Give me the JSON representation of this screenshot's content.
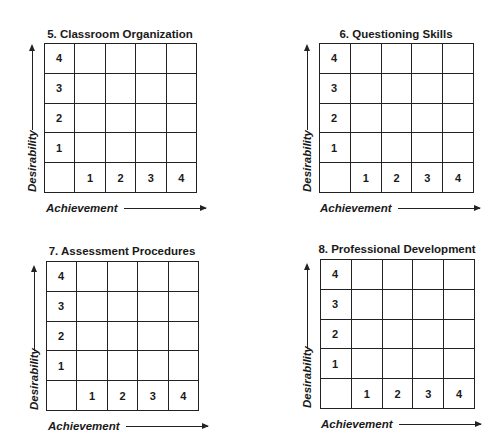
{
  "panels": [
    {
      "title": "5. Classroom Organization",
      "y_axis_label": "Desirability",
      "x_axis_label": "Achievement",
      "y_ticks": [
        "4",
        "3",
        "2",
        "1"
      ],
      "x_ticks": [
        "1",
        "2",
        "3",
        "4"
      ]
    },
    {
      "title": "6. Questioning Skills",
      "y_axis_label": "Desirability",
      "x_axis_label": "Achievement",
      "y_ticks": [
        "4",
        "3",
        "2",
        "1"
      ],
      "x_ticks": [
        "1",
        "2",
        "3",
        "4"
      ]
    },
    {
      "title": "7. Assessment Procedures",
      "y_axis_label": "Desirability",
      "x_axis_label": "Achievement",
      "y_ticks": [
        "4",
        "3",
        "2",
        "1"
      ],
      "x_ticks": [
        "1",
        "2",
        "3",
        "4"
      ]
    },
    {
      "title": "8. Professional Development",
      "y_axis_label": "Desirability",
      "x_axis_label": "Achievement",
      "y_ticks": [
        "4",
        "3",
        "2",
        "1"
      ],
      "x_ticks": [
        "1",
        "2",
        "3",
        "4"
      ]
    }
  ]
}
